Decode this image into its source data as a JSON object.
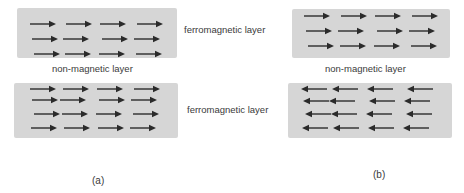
{
  "figure": {
    "panel_a": {
      "caption": "(a)",
      "top_layer": {
        "label": "ferromagnetic layer",
        "direction": "right",
        "rows": 3,
        "arrows_per_row": 4
      },
      "spacer_label": "non-magnetic layer",
      "bottom_layer": {
        "label": "ferromagnetic layer",
        "direction": "right",
        "rows": 4,
        "arrows_per_row": 4
      }
    },
    "panel_b": {
      "caption": "(b)",
      "top_layer": {
        "direction": "right",
        "rows": 3,
        "arrows_per_row": 4
      },
      "spacer_label": "non-magnetic layer",
      "bottom_layer": {
        "direction": "left",
        "rows": 4,
        "arrows_per_row": 4
      }
    },
    "colors": {
      "layer_fill": "#d6d6d6",
      "arrow": "#2b2b2b",
      "text": "#3a3a3a"
    }
  }
}
